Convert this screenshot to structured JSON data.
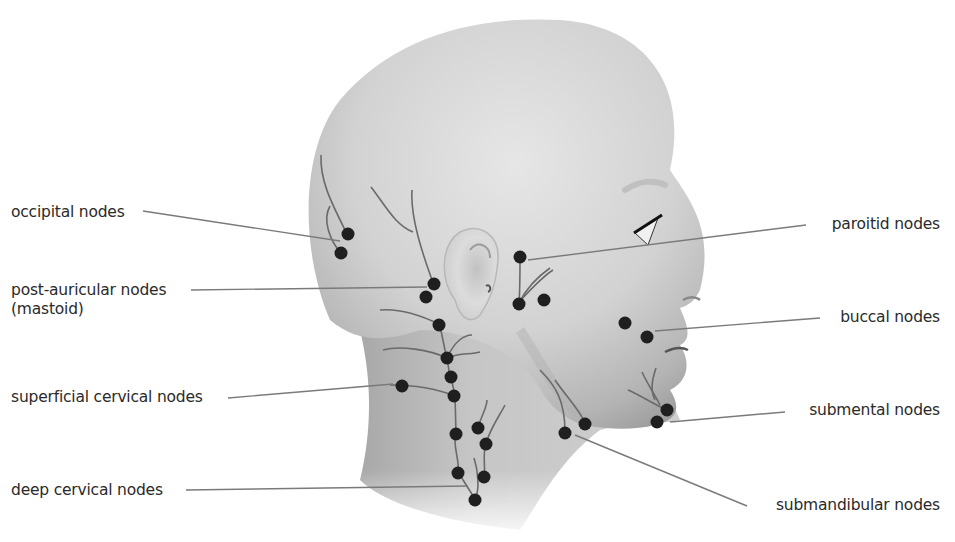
{
  "diagram": {
    "type": "anatomical-illustration",
    "colors": {
      "skin_light": "#e4e4e4",
      "skin_mid": "#c8c8c8",
      "skin_dark": "#9e9e9e",
      "node": "#1f1f1f",
      "vessel": "#6a6a6a",
      "leader_line": "#7a7a7a",
      "text": "#2a2a2a"
    },
    "labels_left": [
      {
        "text": "occipital nodes"
      },
      {
        "text": "post-auricular nodes"
      },
      {
        "text": "(mastoid)"
      },
      {
        "text": "superficial cervical nodes"
      },
      {
        "text": "deep cervical nodes"
      }
    ],
    "labels_right": [
      {
        "text": "paroitid nodes"
      },
      {
        "text": "buccal nodes"
      },
      {
        "text": "submental nodes"
      },
      {
        "text": "submandibular nodes"
      }
    ]
  }
}
